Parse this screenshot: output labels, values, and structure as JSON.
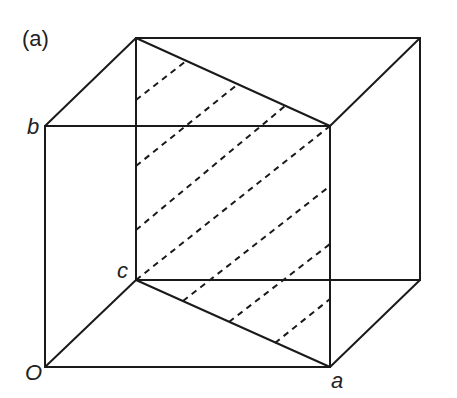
{
  "figure": {
    "panel_label": "(a)",
    "vertex_labels": {
      "origin": "O",
      "a": "a",
      "b": "b",
      "c": "c"
    },
    "line_color": "#1a1a1a"
  }
}
